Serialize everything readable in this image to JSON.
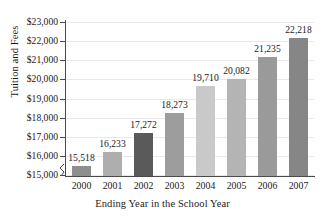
{
  "chart_data": {
    "type": "bar",
    "title": "",
    "xlabel": "Ending Year in the School Year",
    "ylabel": "Tuition and Fees",
    "categories": [
      "2000",
      "2001",
      "2002",
      "2003",
      "2004",
      "2005",
      "2006",
      "2007"
    ],
    "values": [
      15518,
      16233,
      17272,
      18273,
      19710,
      20082,
      21235,
      22218
    ],
    "value_labels": [
      "15,518",
      "16,233",
      "17,272",
      "18,273",
      "19,710",
      "20,082",
      "21,235",
      "22,218"
    ],
    "bar_colors": [
      "#8e8e8e",
      "#aeaeae",
      "#5a5a5a",
      "#9d9d9d",
      "#c9c9c9",
      "#b4b4b4",
      "#9a9a9a",
      "#868686"
    ],
    "ylim": [
      15000,
      23000
    ],
    "y_tick_labels": [
      "$23,000",
      "$22,000",
      "$21,000",
      "$20,000",
      "$19,000",
      "$18,000",
      "$17,000",
      "$16,000",
      "$15,000"
    ],
    "y_tick_values": [
      23000,
      22000,
      21000,
      20000,
      19000,
      18000,
      17000,
      16000,
      15000
    ],
    "grid": true,
    "legend": "none",
    "axis_break": true,
    "axis_color": "#4a4a4a",
    "gridline_color": "#e9e9ec",
    "background": "#ffffff"
  }
}
